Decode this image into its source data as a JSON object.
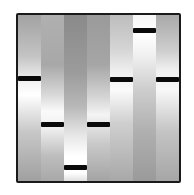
{
  "figure": {
    "type": "gel-electrophoresis-lanes",
    "lane_count": 7,
    "frame_color": "#1a1a1a",
    "band_color": "#0a0a0a",
    "lanes": [
      {
        "index": 1,
        "band_top_pct": 36.5,
        "gradient": "linear-gradient(to bottom, #a2a2a2 0%, #c4c4c4 25%, #f2f2f2 40%, #ffffff 48%, #c8c8c8 70%, #a0a0a0 100%)"
      },
      {
        "index": 2,
        "band_top_pct": 64.5,
        "gradient": "linear-gradient(to bottom, #b0b0b0 0%, #a8a8a8 30%, #d8d8d8 48%, #fafafa 58%, #f0f0f0 68%, #bdbdbd 85%, #a8a8a8 100%)"
      },
      {
        "index": 3,
        "band_top_pct": 90.5,
        "gradient": "linear-gradient(to bottom, #8a8a8a 0%, #9c9c9c 35%, #b8b8b8 55%, #e6e6e6 72%, #ffffff 85%, #ffffff 95%, #e0e0e0 100%)"
      },
      {
        "index": 4,
        "band_top_pct": 64.5,
        "gradient": "linear-gradient(to bottom, #9a9a9a 0%, #a6a6a6 30%, #d6d6d6 50%, #f4f4f4 60%, #c8c8c8 78%, #a4a4a4 100%)"
      },
      {
        "index": 5,
        "band_top_pct": 37.5,
        "gradient": "linear-gradient(to bottom, #bdbdbd 0%, #d4d4d4 20%, #ededed 33%, #fbfbfb 45%, #cfcfcf 65%, #a8a8a8 100%)"
      },
      {
        "index": 6,
        "band_top_pct": 8,
        "gradient": "linear-gradient(to bottom, #f6f6f6 0%, #ffffff 12%, #efefef 25%, #cdcdcd 45%, #b0b0b0 70%, #9a9a9a 100%)"
      },
      {
        "index": 7,
        "band_top_pct": 37.5,
        "gradient": "linear-gradient(to bottom, #a8a8a8 0%, #cfcfcf 22%, #f0f0f0 33%, #f8f8f8 45%, #c4c4c4 70%, #a6a6a6 100%)"
      }
    ]
  }
}
